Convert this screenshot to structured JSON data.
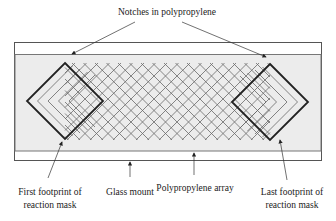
{
  "labels": {
    "notches": "Notches in polypropylene",
    "first_footprint_line1": "First footprint of",
    "first_footprint_line2": "reaction mask",
    "glass_mount": "Glass mount",
    "polypropylene_array": "Polypropylene array",
    "last_footprint_line1": "Last footprint of",
    "last_footprint_line2": "reaction mask"
  },
  "colors": {
    "outline": "#555555",
    "array_fill": "#ececec",
    "grid_line": "#6a6a6a",
    "mask_line": "#222222"
  }
}
